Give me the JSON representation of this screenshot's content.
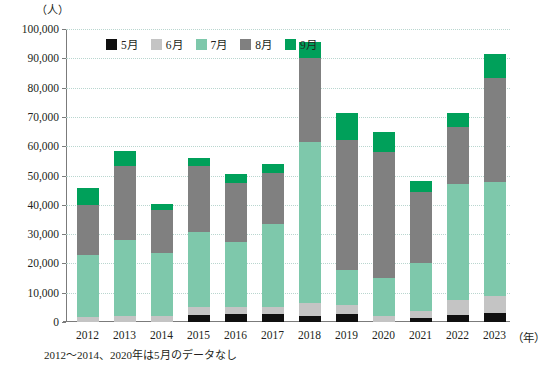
{
  "chart_data": {
    "type": "bar",
    "subtype": "stacked-vertical",
    "title": "",
    "unit_label": "（人）",
    "xlabel": "（年）",
    "ylabel": "",
    "ylim": [
      0,
      100000
    ],
    "ytick_step": 10000,
    "ytick_labels": [
      "0",
      "10,000",
      "20,000",
      "30,000",
      "40,000",
      "50,000",
      "60,000",
      "70,000",
      "80,000",
      "90,000",
      "100,000"
    ],
    "ytick_values": [
      0,
      10000,
      20000,
      30000,
      40000,
      50000,
      60000,
      70000,
      80000,
      90000,
      100000
    ],
    "grid": true,
    "legend_position": "top-inside",
    "categories": [
      "2012",
      "2013",
      "2014",
      "2015",
      "2016",
      "2017",
      "2018",
      "2019",
      "2020",
      "2021",
      "2022",
      "2023"
    ],
    "series": [
      {
        "name": "5月",
        "color": "#101010",
        "values": [
          0,
          0,
          0,
          2500,
          2700,
          2600,
          2000,
          2600,
          0,
          1300,
          2500,
          3200
        ]
      },
      {
        "name": "6月",
        "color": "#c4c4c4",
        "values": [
          1800,
          2100,
          1900,
          2600,
          2400,
          2500,
          4500,
          3100,
          2200,
          2600,
          5000,
          5700
        ]
      },
      {
        "name": "7月",
        "color": "#7ec8ab",
        "values": [
          21000,
          25900,
          21600,
          25700,
          22100,
          28500,
          55000,
          12000,
          12900,
          16200,
          39500,
          38900
        ]
      },
      {
        "name": "8月",
        "color": "#808080",
        "values": [
          17300,
          25400,
          14900,
          22300,
          20400,
          17300,
          28500,
          44300,
          42900,
          24400,
          19500,
          35400
        ]
      },
      {
        "name": "9月",
        "color": "#00a05a",
        "values": [
          5600,
          5100,
          2000,
          2900,
          3000,
          3000,
          5500,
          9500,
          7000,
          3500,
          5000,
          8300
        ]
      }
    ],
    "totals": [
      45700,
      58500,
      40400,
      56000,
      50600,
      53900,
      95500,
      71500,
      65000,
      48000,
      71500,
      91500
    ],
    "annotations": [
      "2012〜2014、2020年は5月のデータなし"
    ]
  },
  "legend": {
    "items": [
      {
        "label": "5月",
        "color": "#101010"
      },
      {
        "label": "6月",
        "color": "#c4c4c4"
      },
      {
        "label": "7月",
        "color": "#7ec8ab"
      },
      {
        "label": "8月",
        "color": "#808080"
      },
      {
        "label": "9月",
        "color": "#00a05a"
      }
    ]
  },
  "footnote": "2012〜2014、2020年は5月のデータなし"
}
